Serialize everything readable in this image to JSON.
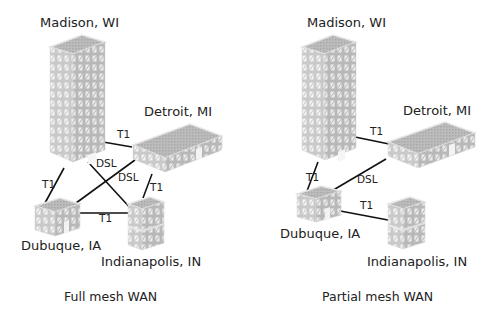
{
  "diagrams": [
    {
      "caption": "Full mesh WAN",
      "sites": {
        "madison": "Madison, WI",
        "detroit": "Detroit, MI",
        "dubuque": "Dubuque, IA",
        "indianapolis": "Indianapolis, IN"
      },
      "links": [
        {
          "from": "Madison, WI",
          "to": "Detroit, MI",
          "type": "T1"
        },
        {
          "from": "Madison, WI",
          "to": "Dubuque, IA",
          "type": "T1"
        },
        {
          "from": "Madison, WI",
          "to": "Indianapolis, IN",
          "type": "DSL"
        },
        {
          "from": "Detroit, MI",
          "to": "Dubuque, IA",
          "type": "DSL"
        },
        {
          "from": "Detroit, MI",
          "to": "Indianapolis, IN",
          "type": "T1"
        },
        {
          "from": "Dubuque, IA",
          "to": "Indianapolis, IN",
          "type": "T1"
        }
      ]
    },
    {
      "caption": "Partial mesh WAN",
      "sites": {
        "madison": "Madison, WI",
        "detroit": "Detroit, MI",
        "dubuque": "Dubuque, IA",
        "indianapolis": "Indianapolis, IN"
      },
      "links": [
        {
          "from": "Madison, WI",
          "to": "Detroit, MI",
          "type": "T1"
        },
        {
          "from": "Madison, WI",
          "to": "Dubuque, IA",
          "type": "T1"
        },
        {
          "from": "Detroit, MI",
          "to": "Dubuque, IA",
          "type": "DSL"
        },
        {
          "from": "Dubuque, IA",
          "to": "Indianapolis, IN",
          "type": "T1"
        }
      ]
    }
  ]
}
